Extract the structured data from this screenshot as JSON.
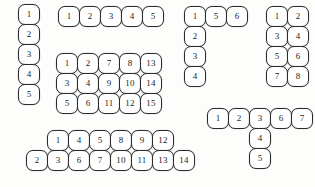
{
  "page": {
    "background_color": "#fdfdfb",
    "cell_fill_color": "#ffffff",
    "cell_stroke_color": "#2b2b2b",
    "label_color": "#1d1d1d",
    "cell_width": 22,
    "cell_height": 21
  },
  "shapes": [
    {
      "id": "shape-vertical-column",
      "name": "vertical-column-1x5",
      "origin": {
        "x": 18,
        "y": 4
      },
      "rows": 5,
      "cols": 1,
      "cells": [
        {
          "label": "1",
          "col": 0,
          "row": 0
        },
        {
          "label": "2",
          "col": 0,
          "row": 1
        },
        {
          "label": "3",
          "col": 0,
          "row": 2
        },
        {
          "label": "4",
          "col": 0,
          "row": 3
        },
        {
          "label": "5",
          "col": 0,
          "row": 4
        }
      ]
    },
    {
      "id": "shape-horizontal-row",
      "name": "horizontal-row-5x1",
      "origin": {
        "x": 58,
        "y": 6
      },
      "rows": 1,
      "cols": 5,
      "cells": [
        {
          "label": "1",
          "col": 0,
          "row": 0
        },
        {
          "label": "2",
          "col": 1,
          "row": 0
        },
        {
          "label": "3",
          "col": 2,
          "row": 0
        },
        {
          "label": "4",
          "col": 3,
          "row": 0
        },
        {
          "label": "5",
          "col": 4,
          "row": 0
        }
      ]
    },
    {
      "id": "shape-rectangle-grid",
      "name": "rectangle-grid-5x3",
      "origin": {
        "x": 56,
        "y": 53
      },
      "rows": 3,
      "cols": 5,
      "cells": [
        {
          "label": "1",
          "col": 0,
          "row": 0
        },
        {
          "label": "2",
          "col": 1,
          "row": 0
        },
        {
          "label": "7",
          "col": 2,
          "row": 0
        },
        {
          "label": "8",
          "col": 3,
          "row": 0
        },
        {
          "label": "13",
          "col": 4,
          "row": 0
        },
        {
          "label": "3",
          "col": 0,
          "row": 1
        },
        {
          "label": "4",
          "col": 1,
          "row": 1
        },
        {
          "label": "9",
          "col": 2,
          "row": 1
        },
        {
          "label": "10",
          "col": 3,
          "row": 1
        },
        {
          "label": "14",
          "col": 4,
          "row": 1
        },
        {
          "label": "5",
          "col": 0,
          "row": 2
        },
        {
          "label": "6",
          "col": 1,
          "row": 2
        },
        {
          "label": "11",
          "col": 2,
          "row": 2
        },
        {
          "label": "12",
          "col": 3,
          "row": 2
        },
        {
          "label": "15",
          "col": 4,
          "row": 2
        }
      ]
    },
    {
      "id": "shape-ell",
      "name": "ell-shape-6-cells",
      "origin": {
        "x": 184,
        "y": 6
      },
      "rows": 4,
      "cols": 3,
      "cells": [
        {
          "label": "1",
          "col": 0,
          "row": 0
        },
        {
          "label": "5",
          "col": 1,
          "row": 0
        },
        {
          "label": "6",
          "col": 2,
          "row": 0
        },
        {
          "label": "2",
          "col": 0,
          "row": 1
        },
        {
          "label": "3",
          "col": 0,
          "row": 2
        },
        {
          "label": "4",
          "col": 0,
          "row": 3
        }
      ]
    },
    {
      "id": "shape-domino-stack",
      "name": "rectangle-grid-2x4",
      "origin": {
        "x": 266,
        "y": 6
      },
      "rows": 4,
      "cols": 2,
      "cells": [
        {
          "label": "1",
          "col": 0,
          "row": 0
        },
        {
          "label": "2",
          "col": 1,
          "row": 0
        },
        {
          "label": "3",
          "col": 0,
          "row": 1
        },
        {
          "label": "4",
          "col": 1,
          "row": 1
        },
        {
          "label": "5",
          "col": 0,
          "row": 2
        },
        {
          "label": "6",
          "col": 1,
          "row": 2
        },
        {
          "label": "7",
          "col": 0,
          "row": 3
        },
        {
          "label": "8",
          "col": 1,
          "row": 3
        }
      ]
    },
    {
      "id": "shape-tee",
      "name": "tee-shape-7-cells",
      "origin": {
        "x": 207,
        "y": 108
      },
      "rows": 3,
      "cols": 5,
      "cells": [
        {
          "label": "1",
          "col": 0,
          "row": 0
        },
        {
          "label": "2",
          "col": 1,
          "row": 0
        },
        {
          "label": "3",
          "col": 2,
          "row": 0
        },
        {
          "label": "6",
          "col": 3,
          "row": 0
        },
        {
          "label": "7",
          "col": 4,
          "row": 0
        },
        {
          "label": "4",
          "col": 2,
          "row": 1
        },
        {
          "label": "5",
          "col": 2,
          "row": 2
        }
      ]
    },
    {
      "id": "shape-staircase",
      "name": "offset-two-row-strip-14-cells",
      "origin": {
        "x": 26,
        "y": 130
      },
      "rows": 2,
      "cols": 8,
      "cells": [
        {
          "label": "1",
          "col": 1,
          "row": 0
        },
        {
          "label": "4",
          "col": 2,
          "row": 0
        },
        {
          "label": "5",
          "col": 3,
          "row": 0
        },
        {
          "label": "8",
          "col": 4,
          "row": 0
        },
        {
          "label": "9",
          "col": 5,
          "row": 0
        },
        {
          "label": "12",
          "col": 6,
          "row": 0
        },
        {
          "label": "2",
          "col": 0,
          "row": 1
        },
        {
          "label": "3",
          "col": 1,
          "row": 1
        },
        {
          "label": "6",
          "col": 2,
          "row": 1
        },
        {
          "label": "7",
          "col": 3,
          "row": 1
        },
        {
          "label": "10",
          "col": 4,
          "row": 1
        },
        {
          "label": "11",
          "col": 5,
          "row": 1
        },
        {
          "label": "13",
          "col": 6,
          "row": 1
        },
        {
          "label": "14",
          "col": 7,
          "row": 1
        }
      ]
    }
  ]
}
